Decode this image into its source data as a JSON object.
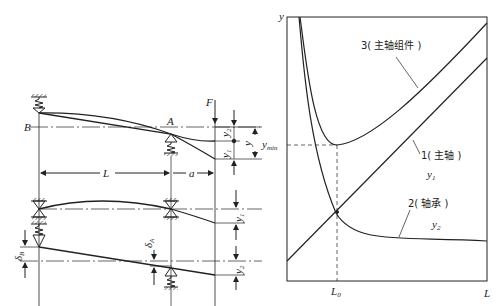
{
  "left_diagram": {
    "labels": {
      "B": "B",
      "A": "A",
      "F": "F",
      "L": "L",
      "a": "a",
      "y": "y",
      "y1": "y",
      "y1_sub": "1",
      "y2": "y",
      "y2_sub": "2",
      "deltaB": "δ",
      "deltaB_sub": "B",
      "deltaA": "δ",
      "deltaA_sub": "A"
    }
  },
  "right_chart": {
    "axis": {
      "y_label": "y",
      "x_label": "L",
      "ymin_label": "y",
      "ymin_sub": "min",
      "L0_label": "L",
      "L0_sub": "0"
    },
    "curves": [
      {
        "id": "3",
        "label": "3( 主轴组件 )"
      },
      {
        "id": "1",
        "label": "1( 主轴 )",
        "symbol": "y",
        "symbol_sub": "1"
      },
      {
        "id": "2",
        "label": "2( 轴承 )",
        "symbol": "y",
        "symbol_sub": "2"
      }
    ]
  }
}
